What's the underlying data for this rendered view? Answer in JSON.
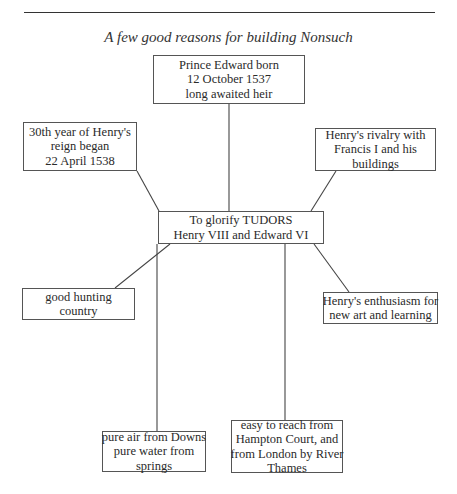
{
  "header": {
    "title": "A few good reasons for building Nonsuch"
  },
  "diagram": {
    "center": {
      "lines": [
        "To glorify TUDORS",
        "Henry VIII and Edward VI"
      ]
    },
    "nodes": [
      {
        "id": "prince-edward",
        "lines": [
          "Prince Edward born",
          "12 October 1537",
          "long awaited heir"
        ]
      },
      {
        "id": "thirtieth-year",
        "lines": [
          "30th year of Henry's",
          "reign began",
          "22 April 1538"
        ]
      },
      {
        "id": "rivalry",
        "lines": [
          "Henry's rivalry with",
          "Francis I and his",
          "buildings"
        ]
      },
      {
        "id": "hunting",
        "lines": [
          "good hunting",
          "country"
        ]
      },
      {
        "id": "enthusiasm",
        "lines": [
          "Henry's enthusiasm for",
          "new art and learning"
        ]
      },
      {
        "id": "pure-air",
        "lines": [
          "pure air from Downs",
          "pure water from",
          "springs"
        ]
      },
      {
        "id": "easy-reach",
        "lines": [
          "easy to reach from",
          "Hampton Court, and",
          "from London by River",
          "Thames"
        ]
      }
    ],
    "colors": {
      "line": "#444444",
      "border": "#555555",
      "text": "#2a2a2a"
    }
  }
}
